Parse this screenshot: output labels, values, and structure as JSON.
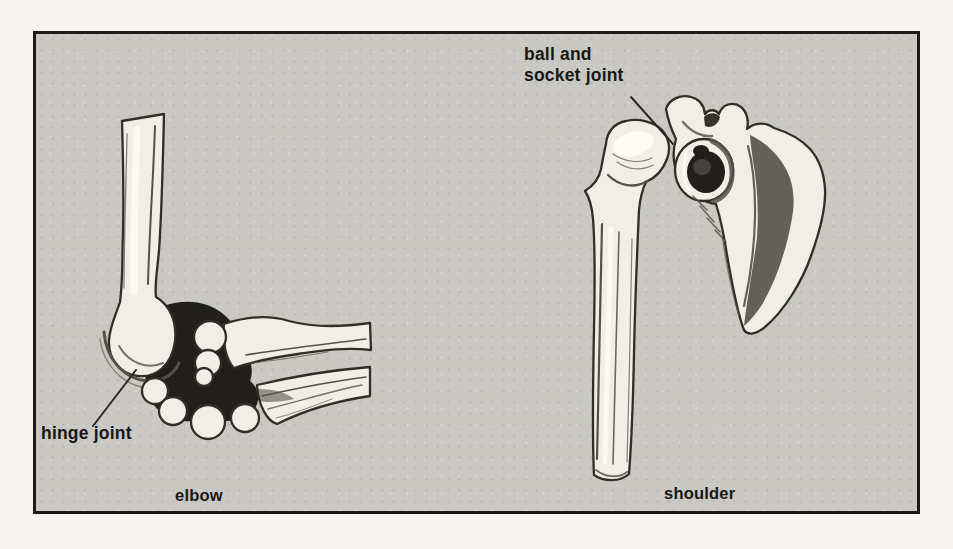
{
  "colors": {
    "page_bg": "#f6f5f1",
    "panel_bg": "#c9c8c3",
    "panel_border": "#1c1b18",
    "bone_fill": "#f0eee6",
    "bone_outline": "#312e29",
    "shadow_dark": "#211f1b",
    "label_text": "#181714",
    "leader_line": "#2b2925"
  },
  "figure": {
    "annotations": {
      "ball_socket_line1": "ball and",
      "ball_socket_line2": "socket joint",
      "hinge": "hinge joint"
    },
    "captions": {
      "left": "elbow",
      "right": "shoulder"
    }
  }
}
